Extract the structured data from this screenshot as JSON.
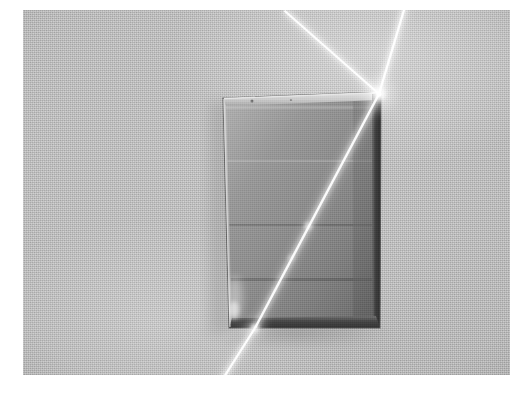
{
  "image": {
    "kind": "photograph",
    "subject": "laser-beam-refraction-through-rectangular-glass-block",
    "width": 527,
    "height": 402,
    "photo_frame": {
      "left": 23,
      "top": 10,
      "width": 487,
      "height": 365
    },
    "palette": {
      "page_margin": "#ffffff",
      "background_surface": "#c2c2c2",
      "background_surface_dark": "#a9a9a9",
      "glass_interior": "#8e8e8e",
      "glass_interior_dark": "#7b7b7b",
      "glass_edge_dark": "#3a3a3a",
      "glass_highlight": "#d8d8d8",
      "beam_core": "#ffffff",
      "beam_glow": "#f2f2f2",
      "shadow": "#9a9a9a"
    },
    "scene_objects": [
      {
        "name": "glass-block",
        "description": "upright rectangular transparent glass slab resting on a light grey textured surface",
        "corners": {
          "top_left": [
            200,
            88
          ],
          "top_right": [
            358,
            82
          ],
          "bottom_right": [
            357,
            318
          ],
          "bottom_left": [
            206,
            318
          ]
        }
      },
      {
        "name": "incident-beam",
        "description": "laser beam arriving from upper right and striking the top-right corner region of the block",
        "from": [
          378,
          10
        ],
        "to": [
          356,
          84
        ]
      },
      {
        "name": "reflected-beam",
        "description": "beam reflected off the glass surface travelling toward the upper left",
        "from": [
          356,
          84
        ],
        "to": [
          272,
          10
        ]
      },
      {
        "name": "refracted-beam",
        "description": "beam bent inside the glass block running diagonally down to the left toward the bottom edge",
        "from": [
          356,
          84
        ],
        "to": [
          232,
          318
        ]
      },
      {
        "name": "exit-beam",
        "description": "beam emerging from the bottom face of the block and continuing down to the lower left across the surface",
        "from": [
          232,
          318
        ],
        "to": [
          196,
          375
        ]
      }
    ],
    "labels": [],
    "annotations": []
  },
  "chart_data": null
}
